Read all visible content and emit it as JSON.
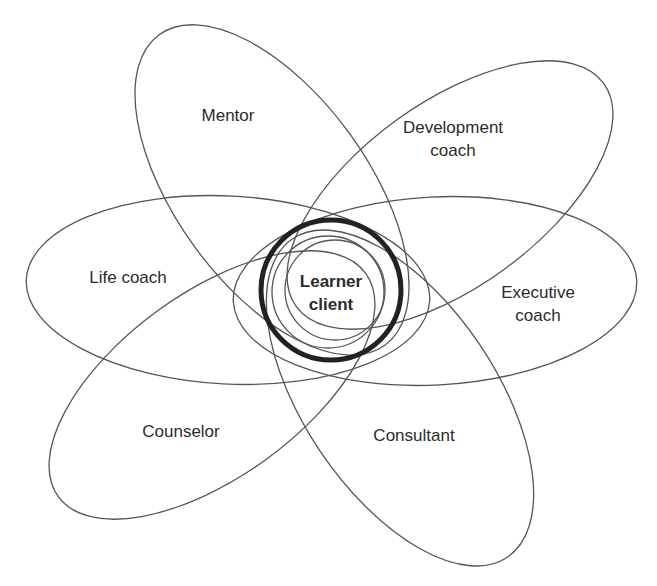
{
  "diagram": {
    "center": {
      "label_line1": "Learner",
      "label_line2": "client"
    },
    "roles": [
      {
        "id": "mentor",
        "line1": "Mentor",
        "line2": ""
      },
      {
        "id": "development-coach",
        "line1": "Development",
        "line2": "coach"
      },
      {
        "id": "life-coach",
        "line1": "Life coach",
        "line2": ""
      },
      {
        "id": "executive-coach",
        "line1": "Executive",
        "line2": "coach"
      },
      {
        "id": "counselor",
        "line1": "Counselor",
        "line2": ""
      },
      {
        "id": "consultant",
        "line1": "Consultant",
        "line2": ""
      }
    ],
    "colors": {
      "petal_stroke": "#555555",
      "center_ring": "#222222",
      "text": "#2b2b2b",
      "background": "#ffffff"
    }
  }
}
